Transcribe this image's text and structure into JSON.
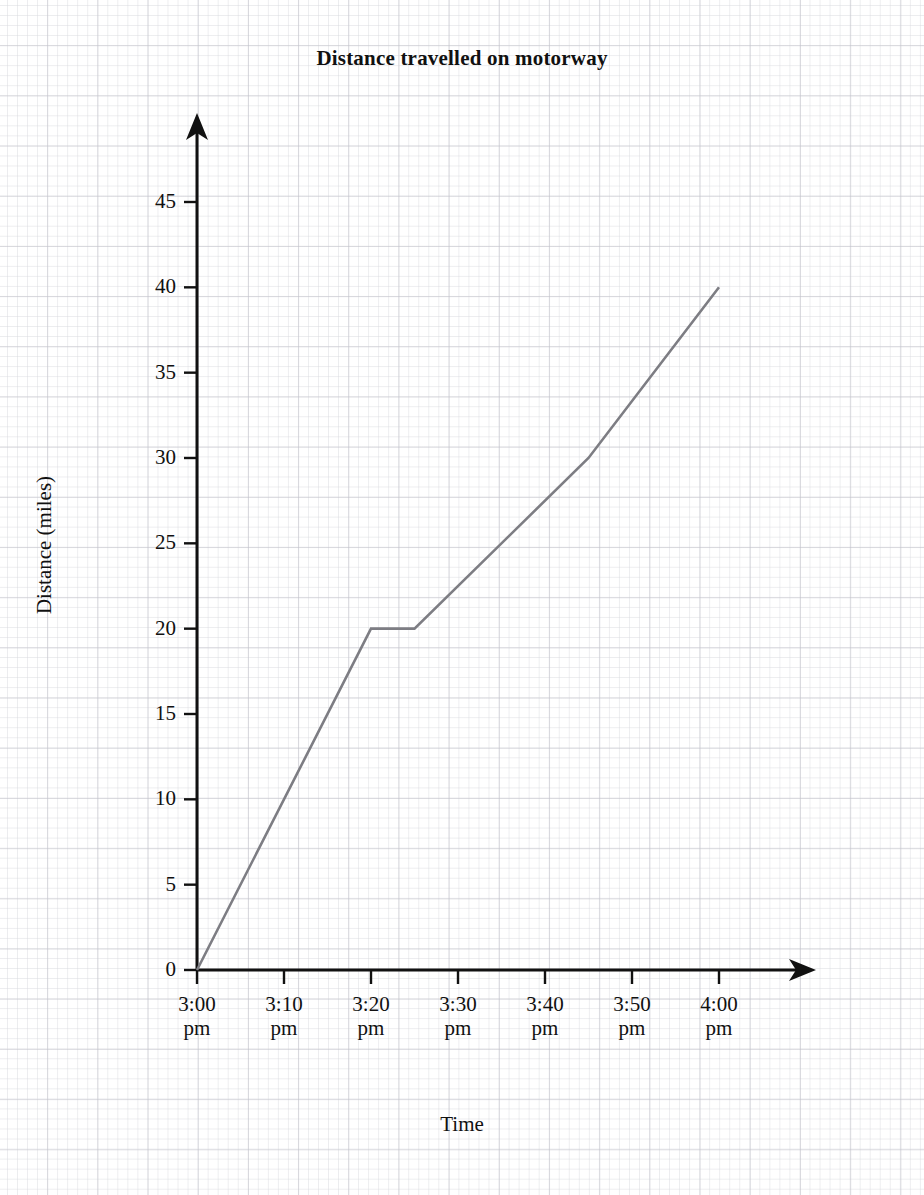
{
  "chart_data": {
    "type": "line",
    "title": "Distance travelled on motorway",
    "xlabel": "Time",
    "ylabel": "Distance (miles)",
    "grid": true,
    "legend": "none",
    "x_tick_labels": [
      "3:00",
      "3:10",
      "3:20",
      "3:30",
      "3:40",
      "3:50",
      "4:00"
    ],
    "x_tick_suffix": "pm",
    "x_tick_minutes": [
      0,
      10,
      20,
      30,
      40,
      50,
      60
    ],
    "xlim_minutes": [
      0,
      60
    ],
    "y_tick_labels": [
      "0",
      "5",
      "10",
      "15",
      "20",
      "25",
      "30",
      "35",
      "40",
      "45"
    ],
    "y_tick_values": [
      0,
      5,
      10,
      15,
      20,
      25,
      30,
      35,
      40,
      45
    ],
    "ylim": [
      0,
      45
    ],
    "series": [
      {
        "name": "Distance travelled",
        "color": "#7d7d83",
        "x": [
          0,
          20,
          25,
          45,
          60
        ],
        "x_labels": [
          "3:00 pm",
          "3:20 pm",
          "3:25 pm",
          "3:45 pm",
          "4:00 pm"
        ],
        "y": [
          0,
          20,
          20,
          30,
          40
        ]
      }
    ],
    "axis_color": "#111111",
    "grid_color": "#9ca0ad"
  }
}
